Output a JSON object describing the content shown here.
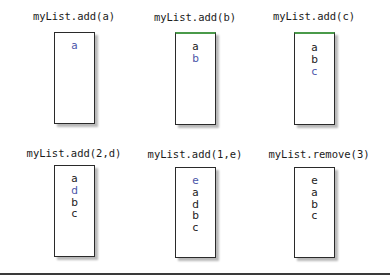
{
  "colors": {
    "border": "#2a2a2a",
    "highlight_item": "#4a55a8",
    "normal_item": "#1a1a1a",
    "green_top_border": "#4a9a4a"
  },
  "steps": [
    {
      "title": "myList.add(a)",
      "items": [
        {
          "text": "a",
          "new": true
        }
      ]
    },
    {
      "title": "myList.add(b)",
      "items": [
        {
          "text": "a",
          "new": false
        },
        {
          "text": "b",
          "new": true
        }
      ]
    },
    {
      "title": "myList.add(c)",
      "items": [
        {
          "text": "a",
          "new": false
        },
        {
          "text": "b",
          "new": false
        },
        {
          "text": "c",
          "new": true
        }
      ]
    },
    {
      "title": "myList.add(2,d)",
      "items": [
        {
          "text": "a",
          "new": false
        },
        {
          "text": "d",
          "new": true
        },
        {
          "text": "b",
          "new": false
        },
        {
          "text": "c",
          "new": false
        }
      ]
    },
    {
      "title": "myList.add(1,e)",
      "items": [
        {
          "text": "e",
          "new": true
        },
        {
          "text": "a",
          "new": false
        },
        {
          "text": "d",
          "new": false
        },
        {
          "text": "b",
          "new": false
        },
        {
          "text": "c",
          "new": false
        }
      ]
    },
    {
      "title": "myList.remove(3)",
      "items": [
        {
          "text": "e",
          "new": false
        },
        {
          "text": "a",
          "new": false
        },
        {
          "text": "b",
          "new": false
        },
        {
          "text": "c",
          "new": false
        }
      ]
    }
  ]
}
